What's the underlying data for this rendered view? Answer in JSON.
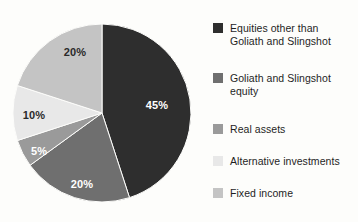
{
  "chart_data": {
    "type": "pie",
    "title": "",
    "subtitle": "",
    "xlabel": "",
    "ylabel": "",
    "grid": false,
    "legend_position": "right",
    "start_angle_deg": 0,
    "direction": "clockwise",
    "categories": [
      "Equities other than Goliath and Slingshot",
      "Goliath and Slingshot equity",
      "Real assets",
      "Alternative investments",
      "Fixed income"
    ],
    "values": [
      45,
      20,
      5,
      10,
      20
    ],
    "data_labels": [
      "45%",
      "20%",
      "5%",
      "10%",
      "20%"
    ],
    "colors": [
      "#2e2e2e",
      "#6f6f6f",
      "#9a9a9a",
      "#e8e8e8",
      "#c4c4c4"
    ],
    "label_text_colors": [
      "#ffffff",
      "#ffffff",
      "#ffffff",
      "#2a2a2a",
      "#2a2a2a"
    ],
    "units": "percent",
    "total": 100
  },
  "pie": {
    "center_x": 102,
    "center_y": 113,
    "radius": 89,
    "slices": [
      {
        "name": "Equities other than Goliath and Slingshot",
        "value": 45,
        "label": "45%",
        "color": "#2e2e2e",
        "label_color": "#ffffff",
        "label_x": 157,
        "label_y": 109
      },
      {
        "name": "Goliath and Slingshot equity",
        "value": 20,
        "label": "20%",
        "color": "#6f6f6f",
        "label_color": "#ffffff",
        "label_x": 82,
        "label_y": 188
      },
      {
        "name": "Real assets",
        "value": 5,
        "label": "5%",
        "color": "#9a9a9a",
        "label_color": "#ffffff",
        "label_x": 39,
        "label_y": 155
      },
      {
        "name": "Alternative investments",
        "value": 10,
        "label": "10%",
        "color": "#e8e8e8",
        "label_color": "#2a2a2a",
        "label_x": 34,
        "label_y": 119
      },
      {
        "name": "Fixed income",
        "value": 20,
        "label": "20%",
        "color": "#c4c4c4",
        "label_color": "#2a2a2a",
        "label_x": 75,
        "label_y": 56
      }
    ]
  },
  "legend": {
    "items": [
      {
        "label": "Equities other than\nGoliath and Slingshot",
        "color": "#2e2e2e",
        "swatch_name": "legend-swatch-equities-other"
      },
      {
        "label": "Goliath and Slingshot\nequity",
        "color": "#6f6f6f",
        "swatch_name": "legend-swatch-goliath-slingshot-equity"
      },
      {
        "label": "Real assets",
        "color": "#9a9a9a",
        "swatch_name": "legend-swatch-real-assets"
      },
      {
        "label": "Alternative investments",
        "color": "#e8e8e8",
        "swatch_name": "legend-swatch-alternative-investments"
      },
      {
        "label": "Fixed income",
        "color": "#c4c4c4",
        "swatch_name": "legend-swatch-fixed-income"
      }
    ]
  }
}
